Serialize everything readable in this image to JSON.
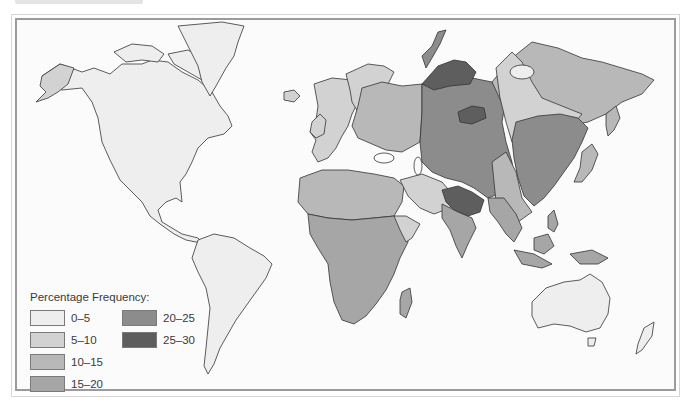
{
  "map": {
    "type": "choropleth",
    "projection": "world",
    "title": "",
    "measure": "Percentage Frequency"
  },
  "legend": {
    "title": "Percentage Frequency:",
    "items": [
      {
        "label": "0–5",
        "color": "#eeeeee"
      },
      {
        "label": "5–10",
        "color": "#d2d2d2"
      },
      {
        "label": "10–15",
        "color": "#b8b8b8"
      },
      {
        "label": "15–20",
        "color": "#a6a6a6"
      },
      {
        "label": "20–25",
        "color": "#8c8c8c"
      },
      {
        "label": "25–30",
        "color": "#5e5e5e"
      }
    ]
  },
  "regions": [
    {
      "name": "North America",
      "class": "0–5"
    },
    {
      "name": "Alaska (west)",
      "class": "5–10"
    },
    {
      "name": "Greenland",
      "class": "0–5"
    },
    {
      "name": "South America",
      "class": "0–5"
    },
    {
      "name": "Australia",
      "class": "0–5"
    },
    {
      "name": "Western Europe",
      "class": "5–10"
    },
    {
      "name": "Eastern Europe",
      "class": "10–15"
    },
    {
      "name": "North Africa",
      "class": "10–15"
    },
    {
      "name": "Sub-Saharan Africa",
      "class": "15–20"
    },
    {
      "name": "Arabian Peninsula",
      "class": "5–10"
    },
    {
      "name": "Central Asia / Siberia (west)",
      "class": "20–25"
    },
    {
      "name": "Urals / Northern Siberia",
      "class": "25–30"
    },
    {
      "name": "Himalaya / Tibet",
      "class": "25–30"
    },
    {
      "name": "Eastern Siberia",
      "class": "10–15"
    },
    {
      "name": "Northern China / Manchuria",
      "class": "20–25"
    },
    {
      "name": "Southeast Asia",
      "class": "15–20"
    },
    {
      "name": "Japan",
      "class": "10–15"
    }
  ]
}
